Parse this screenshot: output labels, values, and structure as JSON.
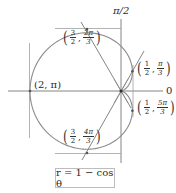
{
  "diagram": {
    "type": "polar-curve",
    "equation_label": "r = 1 − cos θ",
    "axis_labels": {
      "polar_axis": "0",
      "vertical_axis": "π/2"
    },
    "points": [
      {
        "label": "(2, π)",
        "r": "2",
        "theta": "π"
      },
      {
        "r_num": "3",
        "r_den": "2",
        "theta_num": "2π",
        "theta_den": "3",
        "r": "3/2",
        "theta": "2π/3"
      },
      {
        "r_num": "1",
        "r_den": "2",
        "theta_num": "π",
        "theta_den": "3",
        "r": "1/2",
        "theta": "π/3"
      },
      {
        "r_num": "1",
        "r_den": "2",
        "theta_num": "5π",
        "theta_den": "3",
        "r": "1/2",
        "theta": "5π/3"
      },
      {
        "r_num": "3",
        "r_den": "2",
        "theta_num": "4π",
        "theta_den": "3",
        "r": "3/2",
        "theta": "4π/3"
      }
    ],
    "tangent_lines": [
      "horizontal tangent at (3/2, 2π/3)",
      "horizontal tangent at (3/2, 4π/3)",
      "vertical tangent at (2, π)",
      "vertical tangent at (1/2, π/3) and (1/2, 5π/3)",
      "tangent lines at the pole"
    ],
    "colors": {
      "curve": "#8a8a8a",
      "lines": "#9a9a9a",
      "axes": "#777777",
      "text": "#2a2a2a"
    }
  },
  "chart_data": {
    "type": "polar",
    "title": "",
    "equation": "r = 1 − cos θ",
    "curve": "cardioid",
    "theta_range": [
      0,
      6.2832
    ],
    "labeled_points": [
      {
        "r": 2,
        "theta": "π"
      },
      {
        "r": 1.5,
        "theta": "2π/3"
      },
      {
        "r": 0.5,
        "theta": "π/3"
      },
      {
        "r": 0.5,
        "theta": "5π/3"
      },
      {
        "r": 1.5,
        "theta": "4π/3"
      }
    ],
    "axis_labels": [
      "0",
      "π/2"
    ]
  }
}
